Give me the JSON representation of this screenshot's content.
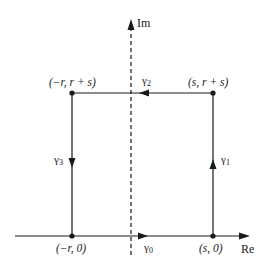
{
  "diagram": {
    "axes": {
      "real_label": "Re",
      "imag_label": "Im"
    },
    "vertices": [
      {
        "id": "bottom-left",
        "label": "(−r, 0)"
      },
      {
        "id": "bottom-right",
        "label": "(s, 0)"
      },
      {
        "id": "top-right",
        "label": "(s, r + s)"
      },
      {
        "id": "top-left",
        "label": "(−r, r + s)"
      }
    ],
    "segments": [
      {
        "id": "gamma0",
        "label": "γ0",
        "base": "γ",
        "sub": "0",
        "direction": "right"
      },
      {
        "id": "gamma1",
        "label": "γ1",
        "base": "γ",
        "sub": "1",
        "direction": "up"
      },
      {
        "id": "gamma2",
        "label": "γ2",
        "base": "γ",
        "sub": "2",
        "direction": "left"
      },
      {
        "id": "gamma3",
        "label": "γ3",
        "base": "γ",
        "sub": "3",
        "direction": "down"
      }
    ],
    "colors": {
      "stroke": "#1a1a1a",
      "background": "#ffffff"
    }
  }
}
